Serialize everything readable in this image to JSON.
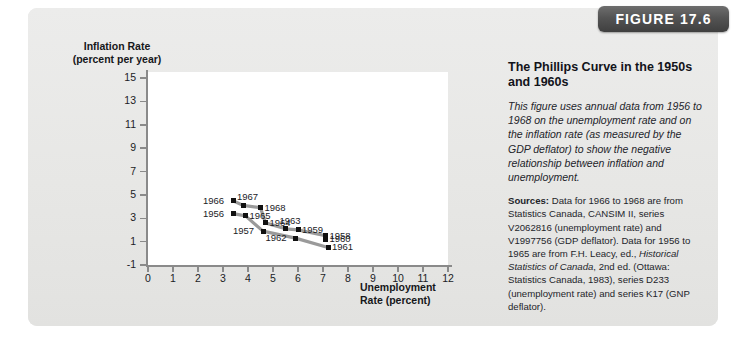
{
  "figure": {
    "badge_label": "FIGURE 17.6"
  },
  "side": {
    "title": "The Phillips Curve in the 1950s and 1960s",
    "description": "This figure uses annual data from 1956 to 1968 on the unemployment rate and on the inflation rate (as measured by the GDP deflator) to show the negative relationship between inflation and unemployment.",
    "sources_label": "Sources:",
    "sources_part1": " Data for 1966 to 1968 are from Statistics Canada, CANSIM II, series V2062816 (unemployment rate) and V1997756 (GDP deflator). Data for 1956 to 1965 are from F.H. Leacy, ed., ",
    "sources_italic": "Historical Statistics of Canada",
    "sources_part2": ", 2nd ed. (Ottawa: Statistics Canada, 1983), series D233 (unemployment rate) and series K17 (GNP deflator)."
  },
  "chart_data": {
    "type": "line",
    "title": "",
    "xlabel": "Unemployment Rate (percent)",
    "ylabel": "Inflation Rate (percent per year)",
    "xlim": [
      0,
      12
    ],
    "ylim": [
      -1,
      15
    ],
    "xticks": [
      0,
      1,
      2,
      3,
      4,
      5,
      6,
      7,
      8,
      9,
      10,
      11,
      12
    ],
    "yticks": [
      -1,
      1,
      3,
      5,
      7,
      9,
      11,
      13,
      15
    ],
    "grid": false,
    "legend": "none",
    "series": [
      {
        "name": "Phillips curve 1956-1968",
        "points": [
          {
            "label": "1956",
            "x": 3.4,
            "y": 3.4,
            "label_pos": "left"
          },
          {
            "label": "1957",
            "x": 4.6,
            "y": 1.9,
            "label_pos": "left"
          },
          {
            "label": "1958",
            "x": 7.1,
            "y": 1.5,
            "label_pos": "right"
          },
          {
            "label": "1959",
            "x": 6.0,
            "y": 2.0,
            "label_pos": "right"
          },
          {
            "label": "1960",
            "x": 7.1,
            "y": 1.2,
            "label_pos": "right"
          },
          {
            "label": "1961",
            "x": 7.2,
            "y": 0.5,
            "label_pos": "right"
          },
          {
            "label": "1962",
            "x": 5.9,
            "y": 1.3,
            "label_pos": "left"
          },
          {
            "label": "1963",
            "x": 5.5,
            "y": 2.1,
            "label_pos": "above"
          },
          {
            "label": "1964",
            "x": 4.7,
            "y": 2.6,
            "label_pos": "right"
          },
          {
            "label": "1965",
            "x": 3.9,
            "y": 3.2,
            "label_pos": "right"
          },
          {
            "label": "1966",
            "x": 3.4,
            "y": 4.5,
            "label_pos": "left"
          },
          {
            "label": "1967",
            "x": 3.8,
            "y": 4.1,
            "label_pos": "above"
          },
          {
            "label": "1968",
            "x": 4.5,
            "y": 3.9,
            "label_pos": "right"
          }
        ],
        "path_upper": [
          "1966",
          "1967",
          "1968",
          "1964",
          "1963",
          "1959",
          "1958"
        ],
        "path_lower": [
          "1956",
          "1965",
          "1957",
          "1962",
          "1961"
        ]
      }
    ]
  }
}
